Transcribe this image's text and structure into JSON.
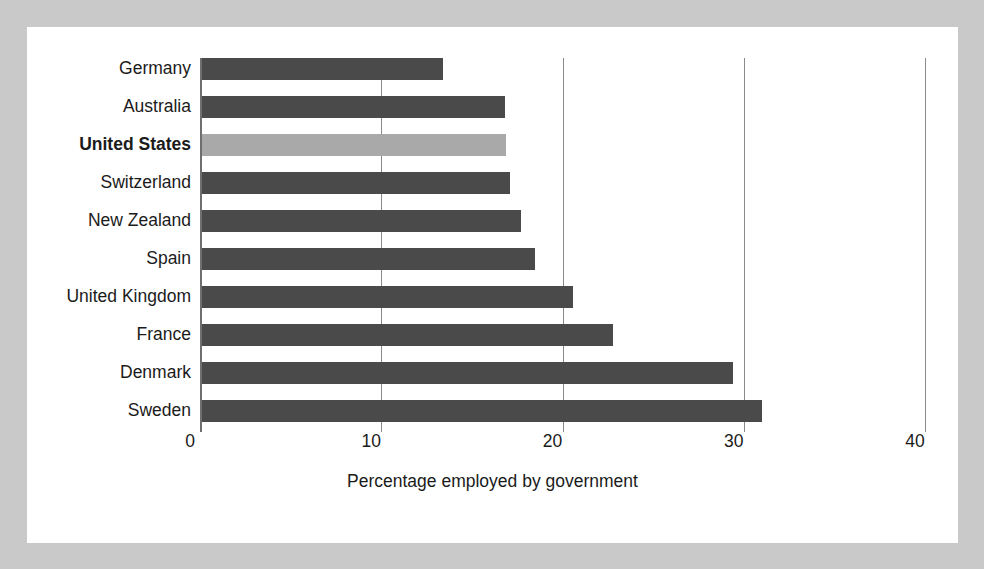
{
  "chart_data": {
    "type": "bar",
    "orientation": "horizontal",
    "title": "",
    "subtitle": "",
    "xlabel": "Percentage employed by government",
    "ylabel": "",
    "xlim": [
      0,
      40
    ],
    "xticks": [
      0,
      10,
      20,
      30,
      40
    ],
    "xtick_labels": [
      "0",
      "10",
      "20",
      "30",
      "40"
    ],
    "grid": "vertical gridlines at 10, 20, 30, 40",
    "legend": "none",
    "categories": [
      "Germany",
      "Australia",
      "United States",
      "Switzerland",
      "New Zealand",
      "Spain",
      "United Kingdom",
      "France",
      "Denmark",
      "Sweden"
    ],
    "values": [
      13.4,
      16.8,
      16.9,
      17.1,
      17.7,
      18.5,
      20.6,
      22.8,
      29.4,
      31.0
    ],
    "highlight_category": "United States",
    "colors": {
      "bar": "#4a4a4a",
      "highlight_bar": "#a9a9a9",
      "panel_background": "#ffffff",
      "figure_background": "#c9c9c9",
      "gridline": "#8a8a8a",
      "axis": "#6f6f6f",
      "text": "#1b1b1b"
    }
  }
}
